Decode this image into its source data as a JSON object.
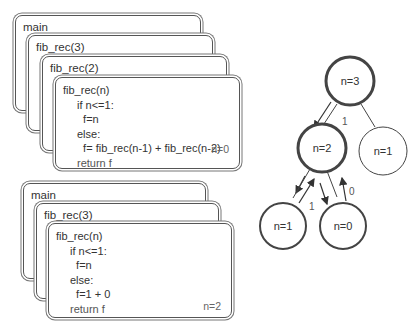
{
  "stack_top": {
    "frames": [
      {
        "title": "main"
      },
      {
        "title": "fib_rec(3)"
      },
      {
        "title": "fib_rec(2)"
      }
    ],
    "active": {
      "title": "fib_rec(n)",
      "lines": [
        "if n<=1:",
        "  f=n",
        "else:",
        "  f= fib_rec(n-1) + fib_rec(n-2)",
        "return f"
      ],
      "n_value": "n=0"
    }
  },
  "stack_bottom": {
    "frames": [
      {
        "title": "main"
      },
      {
        "title": "fib_rec(3)"
      }
    ],
    "active": {
      "title": "fib_rec(n)",
      "lines": [
        "if n<=1:",
        "  f=n",
        "else:",
        "  f=1 + 0",
        "return f"
      ],
      "n_value": "n=2"
    }
  },
  "tree": {
    "nodes": [
      {
        "id": "n3",
        "label": "n=3"
      },
      {
        "id": "n2",
        "label": "n=2"
      },
      {
        "id": "n1_right",
        "label": "n=1"
      },
      {
        "id": "n1_left",
        "label": "n=1"
      },
      {
        "id": "n0",
        "label": "n=0"
      }
    ],
    "edge_labels": {
      "n3_n2_return": "1",
      "n2_n1_return": "1",
      "n2_n0_return": "0"
    }
  }
}
